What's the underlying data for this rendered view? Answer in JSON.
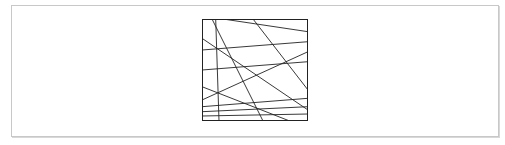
{
  "figure": {
    "type": "line-arrangement",
    "stroke_color": "#222222",
    "border_color": "#222222",
    "frame_color": "#c8c8c8",
    "square": {
      "width": 106,
      "height": 102
    },
    "lines": [
      {
        "x1": 10,
        "y1": 0,
        "x2": 61,
        "y2": 102
      },
      {
        "x1": 13.7,
        "y1": 0,
        "x2": 17,
        "y2": 102
      },
      {
        "x1": 51,
        "y1": 0,
        "x2": 106,
        "y2": 71
      },
      {
        "x1": 21,
        "y1": 0,
        "x2": 106,
        "y2": 12.7
      },
      {
        "x1": 0,
        "y1": 19.3,
        "x2": 106,
        "y2": 91
      },
      {
        "x1": 0,
        "y1": 31,
        "x2": 106,
        "y2": 22.7
      },
      {
        "x1": 0,
        "y1": 51,
        "x2": 106,
        "y2": 42.7
      },
      {
        "x1": 0,
        "y1": 81,
        "x2": 106,
        "y2": 32.7
      },
      {
        "x1": 0,
        "y1": 67.7,
        "x2": 87.7,
        "y2": 102
      },
      {
        "x1": 0,
        "y1": 87.7,
        "x2": 106,
        "y2": 79.3
      },
      {
        "x1": 0,
        "y1": 92.7,
        "x2": 106,
        "y2": 87.7
      },
      {
        "x1": 0,
        "y1": 97,
        "x2": 106,
        "y2": 95
      }
    ]
  }
}
